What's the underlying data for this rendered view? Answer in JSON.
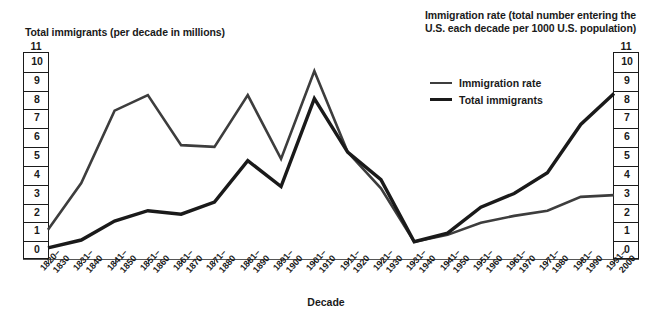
{
  "chart_data": {
    "type": "line",
    "title": "",
    "xlabel": "Decade",
    "ylabel_left": "Total immigrants (per decade in millions)",
    "ylabel_right": "Immigration rate (total number entering the U.S. each decade per 1000 U.S. population)",
    "ylim": [
      0,
      11
    ],
    "y_ticks": [
      0,
      1,
      2,
      3,
      4,
      5,
      6,
      7,
      8,
      9,
      10,
      11
    ],
    "grid": true,
    "legend_position": "upper-right-inside",
    "categories": [
      "1820–1830",
      "1831–1840",
      "1841–1850",
      "1851–1860",
      "1861–1870",
      "1871–1880",
      "1881–1890",
      "1891–1900",
      "1901–1910",
      "1911–1920",
      "1921–1930",
      "1931–1940",
      "1941–1950",
      "1951–1960",
      "1961–1970",
      "1971–1980",
      "1981–1990",
      "1991–2000"
    ],
    "categories_split": [
      [
        "1820–",
        "1830"
      ],
      [
        "1831–",
        "1840"
      ],
      [
        "1841–",
        "1850"
      ],
      [
        "1851–",
        "1860"
      ],
      [
        "1861–",
        "1870"
      ],
      [
        "1871–",
        "1880"
      ],
      [
        "1881–",
        "1890"
      ],
      [
        "1891–",
        "1900"
      ],
      [
        "1901–",
        "1910"
      ],
      [
        "1911–",
        "1920"
      ],
      [
        "1921–",
        "1930"
      ],
      [
        "1931–",
        "1940"
      ],
      [
        "1941–",
        "1950"
      ],
      [
        "1951–",
        "1960"
      ],
      [
        "1961–",
        "1970"
      ],
      [
        "1971–",
        "1980"
      ],
      [
        "1981–",
        "1990"
      ],
      [
        "1991–",
        "2000"
      ]
    ],
    "series": [
      {
        "name": "Immigration rate",
        "color": "#3d3d3d",
        "values": [
          1.2,
          3.9,
          8.1,
          9.0,
          6.1,
          6.0,
          9.0,
          5.3,
          10.4,
          5.7,
          3.6,
          0.5,
          0.9,
          1.6,
          2.0,
          2.3,
          3.1,
          3.2
        ]
      },
      {
        "name": "Total immigrants",
        "color": "#1a1a1a",
        "values": [
          0.15,
          0.6,
          1.7,
          2.3,
          2.1,
          2.8,
          5.2,
          3.7,
          8.8,
          5.7,
          4.1,
          0.5,
          1.0,
          2.5,
          3.3,
          4.5,
          7.3,
          9.1
        ]
      }
    ]
  },
  "legend": {
    "items": [
      {
        "label": "Immigration rate"
      },
      {
        "label": "Total immigrants"
      }
    ]
  },
  "axis_titles": {
    "left": "Total immigrants (per decade in millions)",
    "right": "Immigration rate (total number entering the U.S. each decade per 1000 U.S. population)",
    "x": "Decade"
  }
}
